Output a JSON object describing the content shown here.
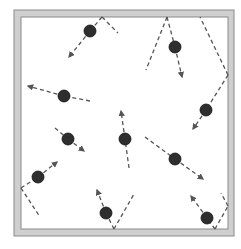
{
  "diagram": {
    "title": "",
    "colors": {
      "background": "#ffffff",
      "frame_fill": "#cfcfcf",
      "frame_edge": "#8a8a8a",
      "particle": "#2e2e2e",
      "particle_edge": "#111111",
      "trajectory": "#555555"
    },
    "frame": {
      "outer": [
        14,
        10,
        234,
        236
      ],
      "inner": [
        21,
        17,
        228,
        229
      ]
    },
    "particles": [
      {
        "id": 1,
        "center": [
          90,
          31
        ],
        "arrow_to": [
          69,
          57
        ],
        "trail": [
          [
            102,
            17
          ],
          [
            118,
            33
          ]
        ],
        "trail_from": [
          102,
          17
        ]
      },
      {
        "id": 2,
        "center": [
          64,
          96
        ],
        "arrow_to": [
          28,
          86
        ],
        "trail": [],
        "trail_from": [
          90,
          101
        ]
      },
      {
        "id": 3,
        "center": [
          175,
          47
        ],
        "arrow_to": [
          182,
          77
        ],
        "trail": [
          [
            167,
            17
          ],
          [
            146,
            70
          ]
        ],
        "trail_from": [
          167,
          17
        ]
      },
      {
        "id": 4,
        "center": [
          206,
          110
        ],
        "arrow_to": [
          193,
          129
        ],
        "trail": [
          [
            228,
            75
          ],
          [
            200,
            17
          ]
        ],
        "trail_from": [
          228,
          75
        ]
      },
      {
        "id": 5,
        "center": [
          68,
          139
        ],
        "arrow_to": [
          84,
          151
        ],
        "trail": [],
        "trail_from": [
          55,
          128
        ]
      },
      {
        "id": 6,
        "center": [
          125,
          139
        ],
        "arrow_to": [
          121,
          111
        ],
        "trail": [],
        "trail_from": [
          129,
          168
        ]
      },
      {
        "id": 7,
        "center": [
          175,
          159
        ],
        "arrow_to": [
          203,
          179
        ],
        "trail": [],
        "trail_from": [
          145,
          137
        ]
      },
      {
        "id": 8,
        "center": [
          38,
          177
        ],
        "arrow_to": [
          57,
          162
        ],
        "trail": [
          [
            21,
            188
          ],
          [
            40,
            217
          ]
        ],
        "trail_from": [
          21,
          188
        ]
      },
      {
        "id": 9,
        "center": [
          106,
          213
        ],
        "arrow_to": [
          97,
          190
        ],
        "trail": [
          [
            114,
            229
          ],
          [
            134,
            194
          ]
        ],
        "trail_from": [
          114,
          229
        ]
      },
      {
        "id": 10,
        "center": [
          207,
          218
        ],
        "arrow_to": [
          191,
          196
        ],
        "trail": [
          [
            215,
            229
          ],
          [
            228,
            206
          ],
          [
            221,
            193
          ]
        ],
        "trail_from": [
          215,
          229
        ]
      }
    ]
  }
}
